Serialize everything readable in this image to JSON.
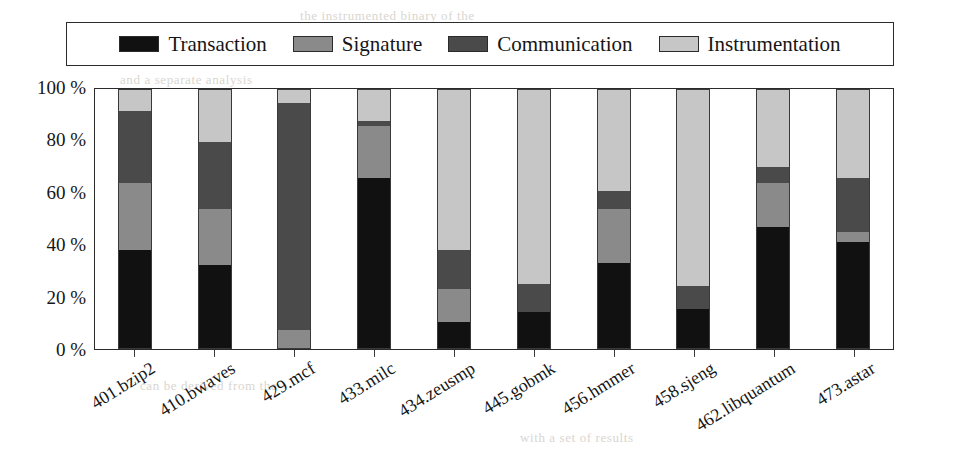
{
  "chart_data": {
    "type": "bar",
    "subtype": "stacked-percentage",
    "title": "",
    "xlabel": "",
    "ylabel": "",
    "ylim": [
      0,
      100
    ],
    "ytick_labels": [
      "0 %",
      "20 %",
      "40 %",
      "60 %",
      "80 %",
      "100 %"
    ],
    "ytick_values": [
      0,
      20,
      40,
      60,
      80,
      100
    ],
    "grid": false,
    "legend_position": "top",
    "categories": [
      "401.bzip2",
      "410.bwaves",
      "429.mcf",
      "433.milc",
      "434.zeusmp",
      "445.gobmk",
      "456.hmmer",
      "458.sjeng",
      "462.libquantum",
      "473.astar"
    ],
    "series": [
      {
        "name": "Transaction",
        "color": "#111111",
        "values": [
          38,
          32,
          0,
          66,
          10,
          14,
          33,
          15,
          47,
          41
        ]
      },
      {
        "name": "Signature",
        "color": "#8a8a8a",
        "values": [
          26,
          22,
          7,
          20,
          13,
          0,
          21,
          0,
          17,
          4
        ]
      },
      {
        "name": "Communication",
        "color": "#4a4a4a",
        "values": [
          28,
          26,
          88,
          2,
          15,
          11,
          7,
          9,
          6,
          21
        ]
      },
      {
        "name": "Instrumentation",
        "color": "#c6c6c6",
        "values": [
          8,
          20,
          5,
          12,
          62,
          75,
          39,
          76,
          30,
          34
        ]
      }
    ]
  },
  "legend": {
    "entries": [
      {
        "label": "Transaction",
        "color": "#111111"
      },
      {
        "label": "Signature",
        "color": "#8a8a8a"
      },
      {
        "label": "Communication",
        "color": "#4a4a4a"
      },
      {
        "label": "Instrumentation",
        "color": "#c6c6c6"
      }
    ]
  },
  "page_bleed": {
    "lines": [
      "the instrumented binary of the",
      "and a separate analysis",
      "in the benchmark suite",
      "4 Experimental Evaluation Results",
      "the evaluation of our approach on the",
      "of the approach on the benchmark",
      "for each of the benchmark programs",
      "can be derived from the",
      "with a set of results"
    ]
  }
}
